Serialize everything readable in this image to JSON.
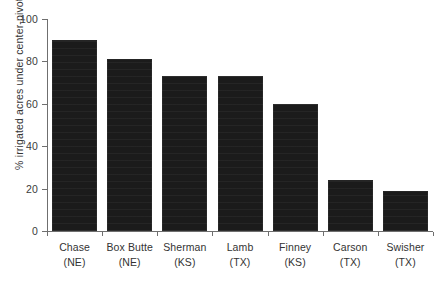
{
  "chart_data": {
    "type": "bar",
    "title": "",
    "subtitle": "",
    "xlabel": "",
    "ylabel": "% irrigated acres under center-pivot",
    "ylim": [
      0,
      100
    ],
    "yticks": [
      "0",
      "20",
      "40",
      "60",
      "80",
      "100"
    ],
    "ytick_values": [
      0,
      20,
      40,
      60,
      80,
      100
    ],
    "grid": false,
    "legend": false,
    "legend_position": "none",
    "bar_color": "#1b1b1b",
    "axis_color": "#6f6f6f",
    "categories": [
      "Chase (NE)",
      "Box Butte (NE)",
      "Sherman (KS)",
      "Lamb (TX)",
      "Finney (KS)",
      "Carson (TX)",
      "Swisher (TX)"
    ],
    "category_names": [
      "Chase",
      "Box Butte",
      "Sherman",
      "Lamb",
      "Finney",
      "Carson",
      "Swisher"
    ],
    "category_states": [
      "(NE)",
      "(NE)",
      "(KS)",
      "(TX)",
      "(KS)",
      "(TX)",
      "(TX)"
    ],
    "values": [
      90,
      81,
      73,
      73,
      60,
      24,
      19
    ]
  }
}
